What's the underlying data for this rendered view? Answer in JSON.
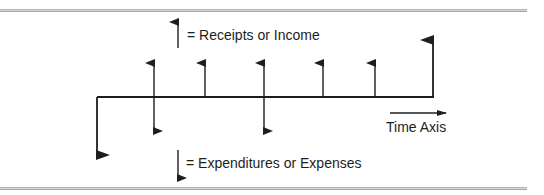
{
  "legend": {
    "receipts_label": "= Receipts or Income",
    "expenditures_label": "= Expenditures or Expenses"
  },
  "axis": {
    "label": "Time Axis"
  },
  "colors": {
    "ink": "#1e1e1e",
    "rule": "#9a9a9a"
  },
  "cash_flows": [
    {
      "period": 0,
      "receipt": 0,
      "expense": 2
    },
    {
      "period": 1,
      "receipt": 1,
      "expense": 1
    },
    {
      "period": 2,
      "receipt": 1,
      "expense": 0
    },
    {
      "period": 3,
      "receipt": 1,
      "expense": 1
    },
    {
      "period": 4,
      "receipt": 1,
      "expense": 0
    },
    {
      "period": 5,
      "receipt": 1,
      "expense": 0
    },
    {
      "period": 6,
      "receipt": 2,
      "expense": 0
    }
  ]
}
